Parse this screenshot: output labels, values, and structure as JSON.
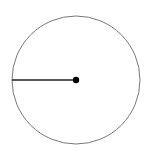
{
  "diagram": {
    "type": "circle-with-radius",
    "circle": {
      "cx": 76,
      "cy": 80,
      "r": 64,
      "stroke": "#777777",
      "fill": "#ffffff"
    },
    "radius_line": {
      "x1": 12,
      "y1": 80,
      "x2": 76,
      "y2": 80,
      "stroke": "#222222"
    },
    "center_point": {
      "cx": 76,
      "cy": 80,
      "r": 3.2,
      "fill": "#000000"
    }
  }
}
